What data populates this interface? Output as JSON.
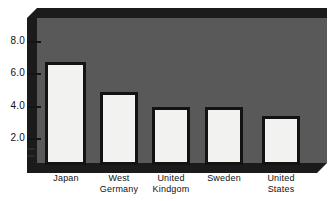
{
  "chart_data": {
    "type": "bar",
    "title": "",
    "subtitle": "",
    "xlabel": "",
    "ylabel": "",
    "categories": [
      "Japan",
      "West Germany",
      "United Kindgom",
      "Sweden",
      "United States"
    ],
    "category_lines": [
      [
        "Japan"
      ],
      [
        "West",
        "Germany"
      ],
      [
        "United",
        "Kindgom"
      ],
      [
        "Sweden"
      ],
      [
        "United",
        "States"
      ]
    ],
    "values": [
      6.4,
      4.5,
      3.6,
      3.6,
      3.0
    ],
    "ylim": [
      0,
      9.2
    ],
    "yticks": [
      2.0,
      4.0,
      6.0,
      8.0
    ],
    "ytick_labels": [
      "2.0",
      "4.0",
      "6.0",
      "8.0"
    ],
    "grid": false,
    "legend": null,
    "style": "3d-slab",
    "colors": {
      "bar_fill": "#f2f2f0",
      "bar_outline": "#131313",
      "plot_background": "#595959",
      "slab_shadow": "#1b1b1b",
      "page_background": "#ffffff",
      "text": "#111111"
    }
  }
}
